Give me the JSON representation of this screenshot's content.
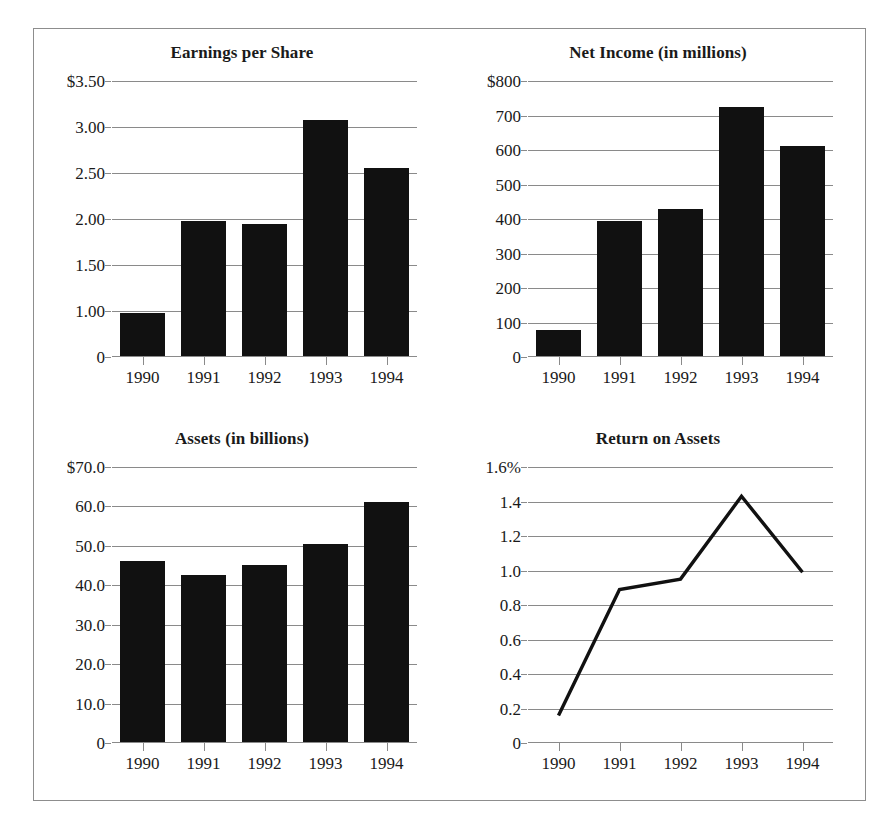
{
  "figure": {
    "border_color": "#8d8d8d",
    "background_color": "#ffffff",
    "bar_color": "#111111",
    "grid_color": "#8a8a8a",
    "line_color": "#111111"
  },
  "chart_data": [
    {
      "id": "earnings-per-share",
      "type": "bar",
      "title": "Earnings per Share",
      "xlabel": "",
      "ylabel": "",
      "categories": [
        "1990",
        "1991",
        "1992",
        "1993",
        "1994"
      ],
      "values": [
        0.93,
        1.97,
        1.93,
        3.06,
        2.54
      ],
      "ytick_labels": [
        "$3.50",
        "3.00",
        "2.50",
        "2.00",
        "1.50",
        "1.00",
        "0"
      ],
      "ytick_values": [
        3.5,
        3.0,
        2.5,
        2.0,
        1.5,
        1.0,
        0
      ],
      "ylim": [
        0,
        3.5
      ],
      "grid": true,
      "legend": "none"
    },
    {
      "id": "net-income",
      "type": "bar",
      "title": "Net Income (in millions)",
      "xlabel": "",
      "ylabel": "",
      "categories": [
        "1990",
        "1991",
        "1992",
        "1993",
        "1994"
      ],
      "values": [
        75,
        390,
        425,
        722,
        610
      ],
      "ytick_labels": [
        "$800",
        "700",
        "600",
        "500",
        "400",
        "300",
        "200",
        "100",
        "0"
      ],
      "ytick_values": [
        800,
        700,
        600,
        500,
        400,
        300,
        200,
        100,
        0
      ],
      "ylim": [
        0,
        800
      ],
      "grid": true,
      "legend": "none"
    },
    {
      "id": "assets",
      "type": "bar",
      "title": "Assets (in billions)",
      "xlabel": "",
      "ylabel": "",
      "categories": [
        "1990",
        "1991",
        "1992",
        "1993",
        "1994"
      ],
      "values": [
        46.0,
        42.3,
        45.0,
        50.3,
        60.8
      ],
      "ytick_labels": [
        "$70.0",
        "60.0",
        "50.0",
        "40.0",
        "30.0",
        "20.0",
        "10.0",
        "0"
      ],
      "ytick_values": [
        70,
        60,
        50,
        40,
        30,
        20,
        10,
        0
      ],
      "ylim": [
        0,
        70
      ],
      "grid": true,
      "legend": "none"
    },
    {
      "id": "return-on-assets",
      "type": "line",
      "title": "Return on Assets",
      "xlabel": "",
      "ylabel": "",
      "categories": [
        "1990",
        "1991",
        "1992",
        "1993",
        "1994"
      ],
      "values": [
        0.16,
        0.89,
        0.95,
        1.43,
        0.99
      ],
      "ytick_labels": [
        "1.6%",
        "1.4",
        "1.2",
        "1.0",
        "0.8",
        "0.6",
        "0.4",
        "0.2",
        "0"
      ],
      "ytick_values": [
        1.6,
        1.4,
        1.2,
        1.0,
        0.8,
        0.6,
        0.4,
        0.2,
        0
      ],
      "ylim": [
        0,
        1.6
      ],
      "grid": true,
      "legend": "none"
    }
  ]
}
